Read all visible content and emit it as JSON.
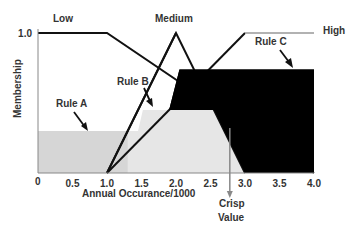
{
  "chart_data": {
    "type": "area",
    "title": "",
    "xlabel": "Annual Occurance/1000",
    "ylabel": "Membership",
    "xlim": [
      0,
      4.0
    ],
    "ylim": [
      0,
      1.0
    ],
    "x_ticks": [
      {
        "value": 0,
        "label": "0"
      },
      {
        "value": 0.5,
        "label": "0.5"
      },
      {
        "value": 1.0,
        "label": "1.0"
      },
      {
        "value": 1.5,
        "label": "1.5"
      },
      {
        "value": 2.0,
        "label": "2.0"
      },
      {
        "value": 2.5,
        "label": "2.5"
      },
      {
        "value": 3.0,
        "label": "3.0"
      },
      {
        "value": 3.5,
        "label": "3.5"
      },
      {
        "value": 4.0,
        "label": "4.0"
      }
    ],
    "y_ticks": [
      {
        "value": 1.0,
        "label": "1.0"
      }
    ],
    "grid": false,
    "membership_functions": [
      {
        "name": "Low",
        "label": "Low",
        "color": "#111111",
        "points": [
          [
            0,
            1.0
          ],
          [
            1.0,
            1.0
          ],
          [
            4.0,
            0.0
          ]
        ]
      },
      {
        "name": "Medium",
        "label": "Medium",
        "color": "#111111",
        "points": [
          [
            1.0,
            0.0
          ],
          [
            2.0,
            1.0
          ],
          [
            3.0,
            0.0
          ]
        ]
      },
      {
        "name": "High",
        "label": "High",
        "color": "#111111",
        "high_line_color": "#999999",
        "points": [
          [
            1.0,
            0.0
          ],
          [
            3.0,
            1.0
          ],
          [
            4.0,
            1.0
          ]
        ]
      }
    ],
    "rule_regions": [
      {
        "name": "Rule A",
        "label": "Rule A",
        "fill": "#d6d6d6",
        "points": [
          [
            0,
            0
          ],
          [
            0,
            0.3
          ],
          [
            1.45,
            0.3
          ],
          [
            1.45,
            0
          ]
        ]
      },
      {
        "name": "Rule B",
        "label": "Rule B",
        "fill": "#e6e6e6",
        "points": [
          [
            1.3,
            0
          ],
          [
            1.3,
            0.3
          ],
          [
            1.45,
            0.3
          ],
          [
            1.52,
            0.45
          ],
          [
            2.55,
            0.45
          ],
          [
            3.0,
            0
          ],
          [
            1.3,
            0
          ]
        ]
      },
      {
        "name": "Rule C",
        "label": "Rule C",
        "fill": "#000000",
        "points": [
          [
            1.9,
            0.45
          ],
          [
            2.55,
            0.45
          ],
          [
            3.0,
            0
          ],
          [
            4.0,
            0
          ],
          [
            4.0,
            0.74
          ],
          [
            2.05,
            0.74
          ],
          [
            1.9,
            0.45
          ]
        ]
      }
    ],
    "crisp_value": {
      "x": 2.78,
      "label_line1": "Crisp",
      "label_line2": "Value",
      "color": "#888888"
    },
    "annotations": [
      {
        "text": "Rule A",
        "target": "Rule A"
      },
      {
        "text": "Rule B",
        "target": "Rule B"
      },
      {
        "text": "Rule C",
        "target": "Rule C"
      }
    ]
  }
}
